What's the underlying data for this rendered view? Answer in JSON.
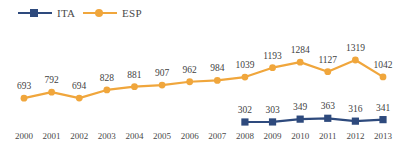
{
  "legend": {
    "items": [
      {
        "label": "ITA",
        "color": "#2E4A7D",
        "marker": "square"
      },
      {
        "label": "ESP",
        "color": "#F0A63C",
        "marker": "circle"
      }
    ]
  },
  "colors": {
    "ita": "#2E4A7D",
    "esp": "#F0A63C",
    "text": "#3f3f3f",
    "background": "#ffffff"
  },
  "chart_data": {
    "type": "line",
    "title": "",
    "xlabel": "",
    "ylabel": "",
    "grid": false,
    "legend_position": "top-left",
    "categories": [
      "2000",
      "2001",
      "2002",
      "2003",
      "2004",
      "2005",
      "2006",
      "2007",
      "2008",
      "2009",
      "2010",
      "2011",
      "2012",
      "2013"
    ],
    "ylim": [
      0,
      1400
    ],
    "series": [
      {
        "name": "ESP",
        "color": "#F0A63C",
        "marker": "circle",
        "x": [
          "2000",
          "2001",
          "2002",
          "2003",
          "2004",
          "2005",
          "2006",
          "2007",
          "2008",
          "2009",
          "2010",
          "2011",
          "2012",
          "2013"
        ],
        "values": [
          693,
          792,
          694,
          828,
          881,
          907,
          962,
          984,
          1039,
          1193,
          1284,
          1127,
          1319,
          1042
        ]
      },
      {
        "name": "ITA",
        "color": "#2E4A7D",
        "marker": "square",
        "x": [
          "2008",
          "2009",
          "2010",
          "2011",
          "2012",
          "2013"
        ],
        "values": [
          302,
          303,
          349,
          363,
          316,
          341
        ]
      }
    ]
  }
}
